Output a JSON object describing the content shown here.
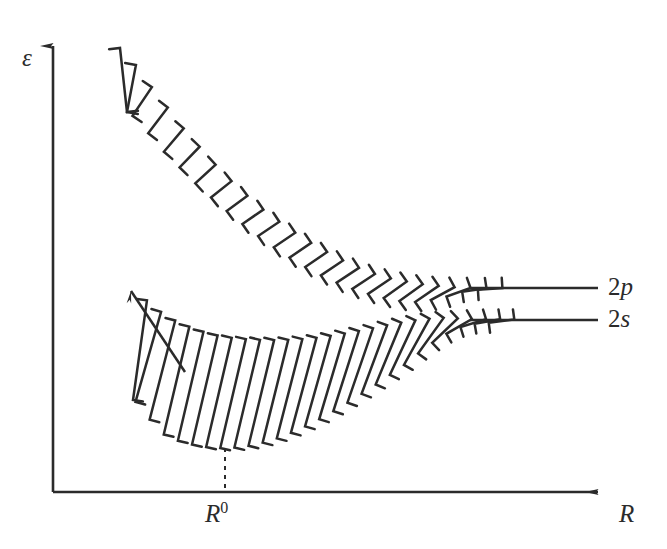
{
  "figure": {
    "kind": "energy-band-diagram",
    "background_color": "#ffffff",
    "ink_color": "#2b2b2b",
    "width": 667,
    "height": 549
  },
  "axes": {
    "y_label": "ε",
    "x_label": "R",
    "x_origin_label": "R",
    "x_origin_superscript": "0",
    "origin_px": [
      53,
      492
    ],
    "y_axis_top_px": [
      53,
      35
    ],
    "x_axis_right_px": [
      610,
      492
    ],
    "arrowheads": "both-ends-outward",
    "ticks": "none",
    "gridlines": "none"
  },
  "levels": [
    {
      "name": "2p",
      "label_number": "2",
      "label_orbital": "p",
      "line_y_px": 288,
      "line_x_start_px": 470,
      "line_x_end_px": 598
    },
    {
      "name": "2s",
      "label_number": "2",
      "label_orbital": "s",
      "line_y_px": 320,
      "line_x_start_px": 470,
      "line_x_end_px": 598
    }
  ],
  "marker": {
    "name": "R0-dashed-drop-line",
    "x_px": 225,
    "y_top_px": 448,
    "y_bottom_px": 492,
    "style": "dashed"
  },
  "chart_data": {
    "type": "line",
    "title": "",
    "xlabel": "R",
    "ylabel": "ε",
    "grid": false,
    "legend": "right-inline-level-labels",
    "annotations": [
      "R⁰",
      "2p",
      "2s"
    ],
    "series": [
      {
        "name": "2p-band-upper-edge",
        "x": [
          120,
          150,
          185,
          225,
          270,
          320,
          370,
          410,
          440,
          470,
          598
        ],
        "y": [
          48,
          85,
          130,
          175,
          215,
          248,
          272,
          282,
          286,
          288,
          288
        ]
      },
      {
        "name": "2p-band-lower-edge",
        "x": [
          127,
          160,
          200,
          245,
          290,
          335,
          380,
          415,
          445,
          470,
          598
        ],
        "y": [
          112,
          148,
          188,
          226,
          258,
          282,
          297,
          302,
          297,
          290,
          288
        ]
      },
      {
        "name": "2s-band-upper-edge",
        "x": [
          133,
          170,
          215,
          265,
          315,
          365,
          405,
          440,
          470,
          598
        ],
        "y": [
          292,
          318,
          335,
          340,
          338,
          330,
          322,
          318,
          319,
          320
        ]
      },
      {
        "name": "2s-band-lower-edge",
        "x": [
          133,
          160,
          190,
          225,
          265,
          310,
          355,
          400,
          440,
          470,
          598
        ],
        "y": [
          400,
          432,
          444,
          448,
          442,
          424,
          398,
          368,
          338,
          324,
          320
        ]
      }
    ],
    "hatching": {
      "style": "parallel-strokes-with-end-serifs",
      "upper_band_stroke_count": 25,
      "lower_band_stroke_count": 27
    },
    "xlim": [
      53,
      610
    ],
    "ylim_px": [
      35,
      492
    ]
  }
}
